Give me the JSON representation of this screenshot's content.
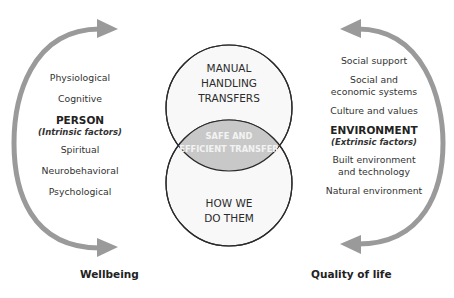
{
  "venn": {
    "top_circle": {
      "label_lines": [
        "MANUAL",
        "HANDLING",
        "TRANSFERS"
      ]
    },
    "bottom_circle": {
      "label_lines": [
        "HOW WE",
        "DO THEM"
      ]
    },
    "overlap": {
      "label_lines": [
        "SAFE AND",
        "EFFICIENT TRANSFER"
      ]
    }
  },
  "left": {
    "items_above": [
      "Physiological",
      "Cognitive"
    ],
    "heading": "PERSON",
    "subheading": "(Intrinsic factors)",
    "items_below": [
      "Spiritual",
      "Neurobehavioral",
      "Psychological"
    ],
    "outcome": "Wellbeing"
  },
  "right": {
    "items_above": [
      "Social support",
      "Social and",
      "economic systems",
      "Culture and values"
    ],
    "heading": "ENVIRONMENT",
    "subheading": "(Extrinsic factors)",
    "items_below": [
      "Built environment",
      "and technology",
      "Natural environment"
    ],
    "outcome": "Quality of life"
  },
  "colors": {
    "arrow": "#9a9a9a",
    "circle_stroke": "#2a2a2a",
    "circle_fill": "#f8f8f8",
    "overlap_fill": "#c8c8c8",
    "text": "#2a2a2a"
  }
}
